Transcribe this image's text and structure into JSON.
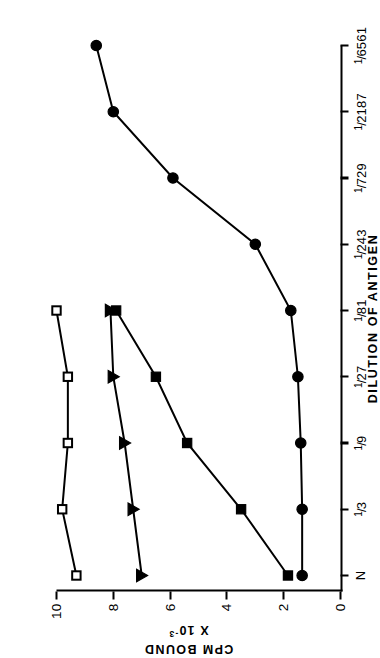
{
  "figure": {
    "background": "#ffffff",
    "ink": "#000000",
    "orientation": "rotated-90-ccw"
  },
  "chart_data": {
    "type": "line",
    "title": "",
    "subtitle": "",
    "xlabel": "DILUTION  OF  ANTIGEN",
    "ylabel_line1": "CPM  BOUND",
    "ylabel_line2": "X 10",
    "ylabel_exponent": "-3",
    "categories": [
      "N",
      "1/3",
      "1/9",
      "1/27",
      "1/81",
      "1/243",
      "1/729",
      "1/2187",
      "1/6561"
    ],
    "category_labels": [
      {
        "numerator": "",
        "denominator": "N",
        "plain": "N"
      },
      {
        "numerator": "1",
        "denominator": "3",
        "plain": "1/3"
      },
      {
        "numerator": "1",
        "denominator": "9",
        "plain": "1/9"
      },
      {
        "numerator": "1",
        "denominator": "27",
        "plain": "1/27"
      },
      {
        "numerator": "1",
        "denominator": "81",
        "plain": "1/81"
      },
      {
        "numerator": "1",
        "denominator": "243",
        "plain": "1/243"
      },
      {
        "numerator": "1",
        "denominator": "729",
        "plain": "1/729"
      },
      {
        "numerator": "1",
        "denominator": "2187",
        "plain": "1/2187"
      },
      {
        "numerator": "1",
        "denominator": "6561",
        "plain": "1/6561"
      }
    ],
    "x_tick_labels": [
      "N",
      "1/3",
      "1/9",
      "1/27",
      "1/81",
      "1/243",
      "1/729",
      "1/2187",
      "1/6561"
    ],
    "y_tick_labels": [
      "0",
      "2",
      "4",
      "6",
      "8",
      "10"
    ],
    "y_ticks": [
      0,
      2,
      4,
      6,
      8,
      10
    ],
    "ylim": [
      0,
      10.6
    ],
    "xlim_categories": [
      0,
      8
    ],
    "grid": false,
    "legend": "none",
    "legend_position": "none",
    "series": [
      {
        "name": "open-square-series",
        "marker": "open-square",
        "marker_fill": "#ffffff",
        "marker_stroke": "#000000",
        "x": [
          "N",
          "1/3",
          "1/9",
          "1/27",
          "1/81"
        ],
        "values": [
          9.3,
          9.8,
          9.6,
          9.6,
          10.0
        ]
      },
      {
        "name": "filled-triangle-series",
        "marker": "filled-triangle-down",
        "marker_fill": "#000000",
        "marker_stroke": "#000000",
        "x": [
          "N",
          "1/3",
          "1/9",
          "1/27",
          "1/81"
        ],
        "values": [
          7.0,
          7.3,
          7.6,
          8.0,
          8.1
        ]
      },
      {
        "name": "filled-square-series",
        "marker": "filled-square",
        "marker_fill": "#000000",
        "marker_stroke": "#000000",
        "x": [
          "N",
          "1/3",
          "1/9",
          "1/27",
          "1/81"
        ],
        "values": [
          1.85,
          3.5,
          5.4,
          6.5,
          7.9
        ]
      },
      {
        "name": "filled-circle-series",
        "marker": "filled-circle",
        "marker_fill": "#000000",
        "marker_stroke": "#000000",
        "x": [
          "N",
          "1/3",
          "1/9",
          "1/27",
          "1/81",
          "1/243",
          "1/729",
          "1/2187",
          "1/6561"
        ],
        "values": [
          1.35,
          1.35,
          1.4,
          1.5,
          1.75,
          3.0,
          5.9,
          8.0,
          8.6
        ]
      }
    ]
  }
}
